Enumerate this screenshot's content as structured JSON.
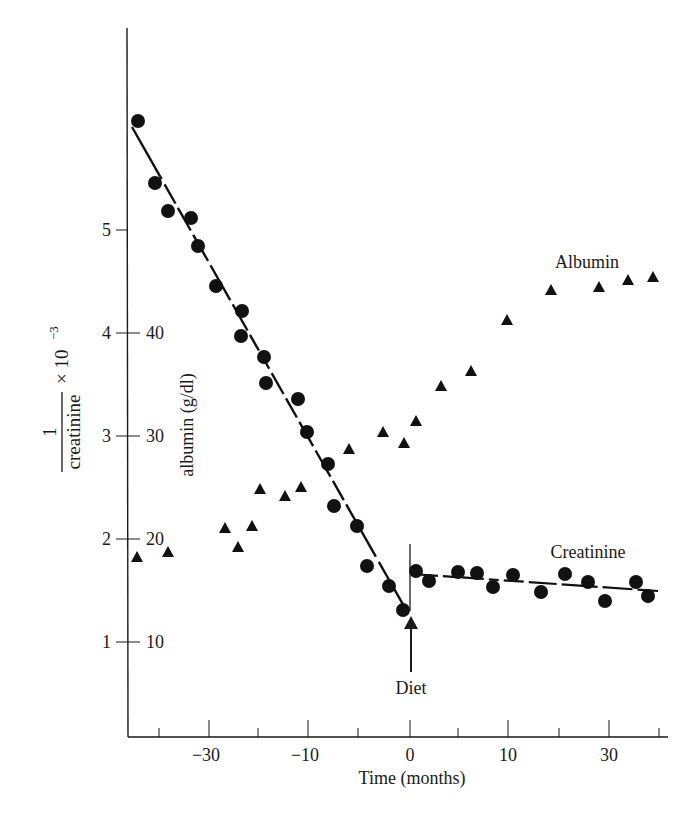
{
  "chart_data": {
    "type": "scatter",
    "title": "",
    "xlabel": "Time (months)",
    "ylabel_left": "1/creatinine × 10^-3",
    "ylabel_left_parts": {
      "numerator": "1",
      "denominator": "creatinine",
      "suffix": "× 10",
      "exponent": "−3"
    },
    "ylabel_inner": "albumin (g/dl)",
    "x_tick_labels": [
      {
        "label": "−30",
        "x": -30
      },
      {
        "label": "−10",
        "x": -10
      },
      {
        "label": "0",
        "x": 0
      },
      {
        "label": "10",
        "x": 10
      },
      {
        "label": "30",
        "x": 30
      }
    ],
    "y_left_ticks": [
      1,
      2,
      3,
      4,
      5
    ],
    "y_inner_ticks": [
      10,
      20,
      30,
      40
    ],
    "ylim_left": [
      0.08,
      6.3
    ],
    "ylim_inner": [
      0.8,
      63
    ],
    "grid": false,
    "annotations": [
      {
        "text": "Albumin",
        "near_series": "Albumin"
      },
      {
        "text": "Creatinine",
        "near_series": "Creatinine"
      },
      {
        "text": "Diet",
        "x": 0,
        "type": "arrow"
      }
    ],
    "series": [
      {
        "name": "Creatinine",
        "marker": "circle",
        "axis": "left",
        "points": [
          [
            -27.2,
            6.06
          ],
          [
            -25.5,
            5.46
          ],
          [
            -24.2,
            5.18
          ],
          [
            -21.9,
            5.12
          ],
          [
            -21.2,
            4.84
          ],
          [
            -19.4,
            4.46
          ],
          [
            -16.8,
            4.21
          ],
          [
            -16.9,
            3.97
          ],
          [
            -14.6,
            3.77
          ],
          [
            -14.4,
            3.51
          ],
          [
            -11.2,
            3.36
          ],
          [
            -10.3,
            3.04
          ],
          [
            -8.2,
            2.73
          ],
          [
            -7.6,
            2.32
          ],
          [
            -5.3,
            2.13
          ],
          [
            -4.3,
            1.74
          ],
          [
            -2.1,
            1.54
          ],
          [
            -0.7,
            1.31
          ],
          [
            0.6,
            1.69
          ],
          [
            1.9,
            1.59
          ],
          [
            4.8,
            1.68
          ],
          [
            6.7,
            1.67
          ],
          [
            8.3,
            1.53
          ],
          [
            10.3,
            1.65
          ],
          [
            13.1,
            1.49
          ],
          [
            15.5,
            1.66
          ],
          [
            17.8,
            1.58
          ],
          [
            19.5,
            1.4
          ],
          [
            22.6,
            1.58
          ],
          [
            23.8,
            1.45
          ]
        ],
        "fit_lines": [
          {
            "from": [
              -28.2,
              6.0
            ],
            "to": [
              -0.6,
              1.3
            ]
          },
          {
            "from": [
              0.2,
              1.62
            ],
            "to": [
              24.5,
              1.48
            ]
          }
        ]
      },
      {
        "name": "Albumin",
        "marker": "triangle",
        "axis": "inner",
        "points": [
          [
            -27.3,
            18.2
          ],
          [
            -24.2,
            18.7
          ],
          [
            -18.5,
            21.1
          ],
          [
            -17.2,
            19.2
          ],
          [
            -15.8,
            21.3
          ],
          [
            -15.0,
            24.9
          ],
          [
            -12.5,
            24.2
          ],
          [
            -10.9,
            25.0
          ],
          [
            -6.1,
            28.7
          ],
          [
            -2.7,
            30.4
          ],
          [
            -0.6,
            29.3
          ],
          [
            0.6,
            31.5
          ],
          [
            3.1,
            34.9
          ],
          [
            6.1,
            36.3
          ],
          [
            9.7,
            41.3
          ],
          [
            14.1,
            44.2
          ],
          [
            18.9,
            44.5
          ],
          [
            21.8,
            45.1
          ],
          [
            24.3,
            45.4
          ]
        ]
      }
    ]
  },
  "pixel_layout": {
    "creatinine_px": [
      [
        138,
        121
      ],
      [
        155,
        183
      ],
      [
        168,
        211
      ],
      [
        191,
        218
      ],
      [
        198,
        246
      ],
      [
        216,
        286
      ],
      [
        242,
        311
      ],
      [
        241,
        336
      ],
      [
        264,
        357
      ],
      [
        266,
        383
      ],
      [
        298,
        399
      ],
      [
        307,
        432
      ],
      [
        328,
        464
      ],
      [
        334,
        506
      ],
      [
        357,
        526
      ],
      [
        367,
        566
      ],
      [
        389,
        586
      ],
      [
        403,
        610
      ],
      [
        416,
        571
      ],
      [
        429,
        581
      ],
      [
        458,
        572
      ],
      [
        477,
        573
      ],
      [
        493,
        587
      ],
      [
        513,
        575
      ],
      [
        541,
        592
      ],
      [
        565,
        574
      ],
      [
        588,
        582
      ],
      [
        605,
        601
      ],
      [
        636,
        582
      ],
      [
        648,
        596
      ]
    ],
    "albumin_px": [
      [
        137,
        557
      ],
      [
        168,
        552
      ],
      [
        225,
        528
      ],
      [
        238,
        547
      ],
      [
        252,
        526
      ],
      [
        260,
        489
      ],
      [
        285,
        496
      ],
      [
        301,
        487
      ],
      [
        349,
        449
      ],
      [
        383,
        432
      ],
      [
        404,
        443
      ],
      [
        416,
        421
      ],
      [
        441,
        386
      ],
      [
        471,
        371
      ],
      [
        507,
        320
      ],
      [
        551,
        290
      ],
      [
        599,
        287
      ],
      [
        628,
        280
      ],
      [
        653,
        277
      ]
    ]
  }
}
